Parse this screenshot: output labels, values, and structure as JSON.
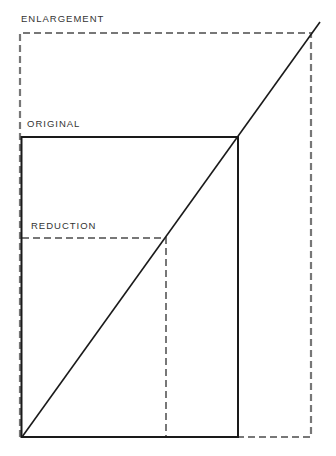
{
  "labels": {
    "enlargement": "ENLARGEMENT",
    "original": "ORIGINAL",
    "reduction": "REDUCTION"
  },
  "colors": {
    "solid": "#1a1a1a",
    "dashed": "#777777",
    "text": "#333333"
  }
}
